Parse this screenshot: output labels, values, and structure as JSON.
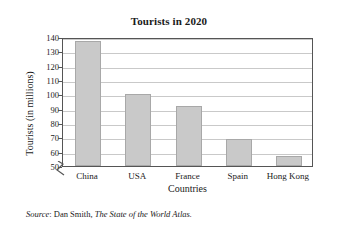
{
  "chart_data": {
    "type": "bar",
    "title": "Tourists in 2020",
    "xlabel": "Countries",
    "ylabel": "Tourists (in millions)",
    "categories": [
      "China",
      "USA",
      "France",
      "Spain",
      "Hong Kong"
    ],
    "values": [
      137,
      100,
      92,
      69,
      57
    ],
    "ylim": [
      50,
      140
    ],
    "yticks": [
      50,
      60,
      70,
      80,
      90,
      100,
      110,
      120,
      130,
      140
    ],
    "ytick_labels": [
      "50",
      "60",
      "70",
      "80",
      "90",
      "100",
      "110",
      "120",
      "130",
      "140"
    ],
    "grid": true,
    "legend": null,
    "axis_break": true,
    "bar_color": "#c9c9c9",
    "bar_edge_color": "#a8a8a8",
    "gridline_color": "#c9c9c9",
    "frame_color": "#555555"
  },
  "source": {
    "label": "Source",
    "separator": ": ",
    "author": "Dan Smith, ",
    "book": "The State of the World Atlas."
  }
}
